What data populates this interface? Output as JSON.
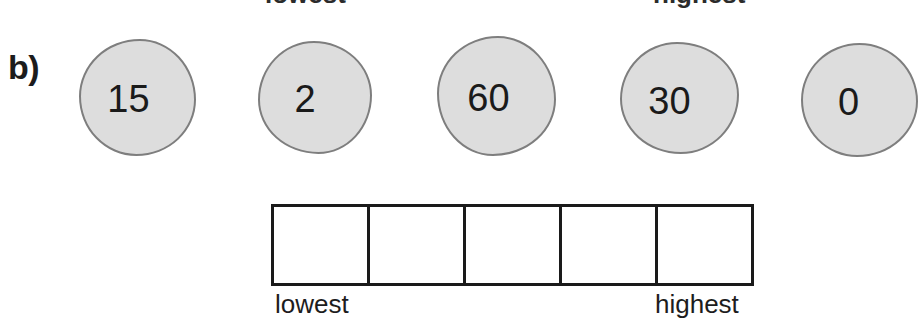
{
  "part_label": "b)",
  "top_captions": {
    "lowest": "lowest",
    "highest": "highest"
  },
  "bottom_captions": {
    "lowest": "lowest",
    "highest": "highest"
  },
  "number_blobs": [
    {
      "value": "15"
    },
    {
      "value": "2"
    },
    {
      "value": "60"
    },
    {
      "value": "30"
    },
    {
      "value": "0"
    }
  ],
  "ranking_grid": {
    "cell_count": 5,
    "cells": [
      {
        "value": ""
      },
      {
        "value": ""
      },
      {
        "value": ""
      },
      {
        "value": ""
      },
      {
        "value": ""
      }
    ]
  },
  "colors": {
    "blob_fill": "#dddddd",
    "blob_border": "#7e7e7e",
    "grid_border": "#1a1a1a",
    "text": "#1a1a1a",
    "background": "#ffffff"
  }
}
